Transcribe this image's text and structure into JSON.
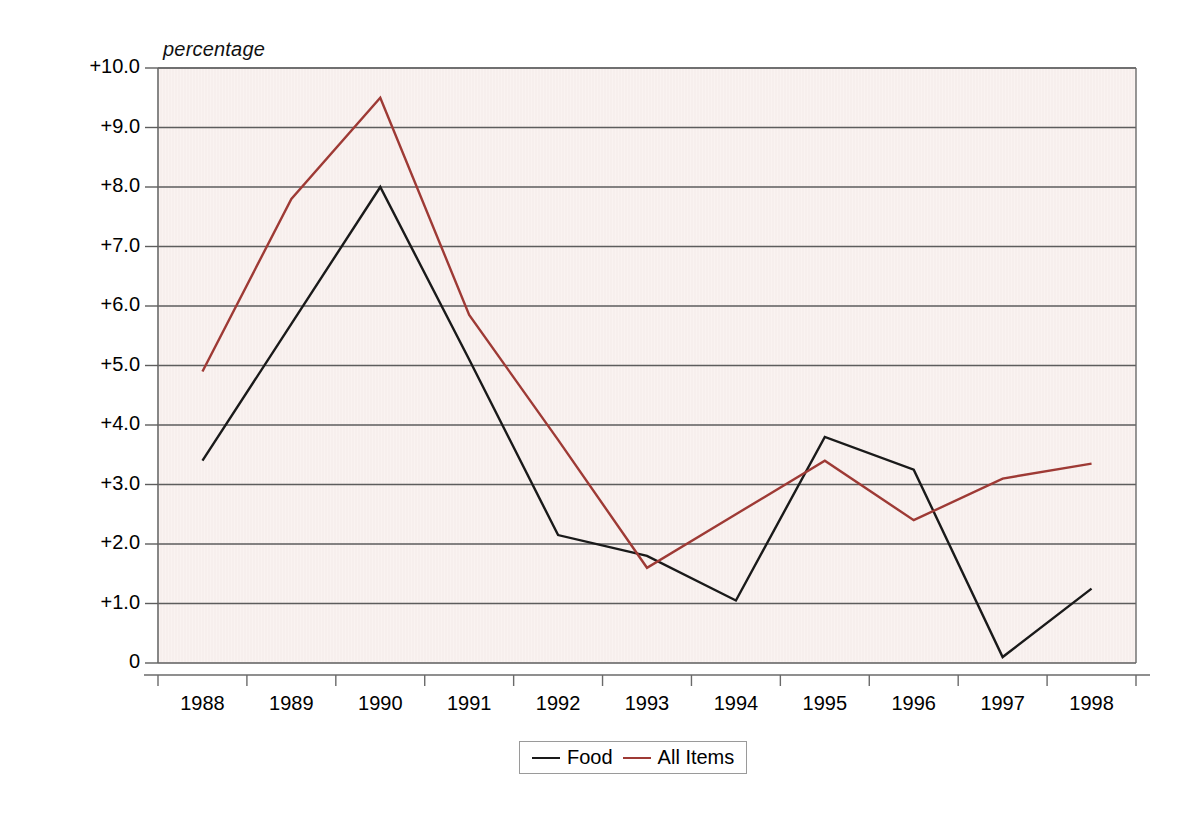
{
  "chart_data": {
    "type": "line",
    "title": "",
    "ylabel": "percentage",
    "xlabel": "",
    "ylim": [
      0,
      10
    ],
    "grid": true,
    "legend_position": "bottom",
    "categories": [
      "1988",
      "1989",
      "1990",
      "1991",
      "1992",
      "1993",
      "1994",
      "1995",
      "1996",
      "1997",
      "1998"
    ],
    "x": [
      1988,
      1989,
      1990,
      1991,
      1992,
      1993,
      1994,
      1995,
      1996,
      1997,
      1998
    ],
    "ytick_labels": [
      "+10.0",
      "+9.0",
      "+8.0",
      "+7.0",
      "+6.0",
      "+5.0",
      "+4.0",
      "+3.0",
      "+2.0",
      "+1.0",
      "0"
    ],
    "ytick_values": [
      10,
      9,
      8,
      7,
      6,
      5,
      4,
      3,
      2,
      1,
      0
    ],
    "series": [
      {
        "name": "Food",
        "color": "#1a1a1a",
        "values": [
          3.4,
          5.7,
          8.0,
          5.1,
          2.15,
          1.8,
          1.05,
          3.8,
          3.25,
          0.1,
          1.25
        ]
      },
      {
        "name": "All Items",
        "color": "#9e3a35",
        "values": [
          4.9,
          7.8,
          9.5,
          5.85,
          3.75,
          1.6,
          2.5,
          3.4,
          2.4,
          3.1,
          3.35
        ]
      }
    ]
  },
  "legend": {
    "items": [
      {
        "label": "Food",
        "color": "#1a1a1a"
      },
      {
        "label": "All Items",
        "color": "#9e3a35"
      }
    ]
  },
  "axes": {
    "y_title": "percentage"
  }
}
